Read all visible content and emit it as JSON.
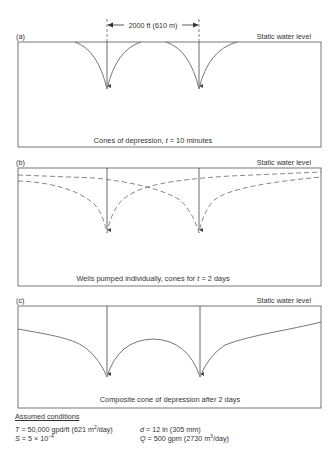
{
  "figure": {
    "dimension_label": "2000 ft (610 m)",
    "panels": [
      {
        "id": "a",
        "tag": "(a)",
        "reference_label": "Static water level",
        "caption_prefix": "Cones of depression, ",
        "caption_var": "t",
        "caption_suffix": " = 10 minutes"
      },
      {
        "id": "b",
        "tag": "(b)",
        "reference_label": "Static water level",
        "caption_prefix": "Wells pumped individually, cones for ",
        "caption_var": "t",
        "caption_suffix": " = 2 days"
      },
      {
        "id": "c",
        "tag": "(c)",
        "reference_label": "Static water level",
        "caption_prefix": "Composite cone of depression after 2 days",
        "caption_var": "",
        "caption_suffix": ""
      }
    ]
  },
  "assumed_conditions": {
    "title": "Assumed conditions",
    "T": {
      "var": "T",
      "value": " = 50,000 gpd/ft (621 m",
      "sup": "2",
      "tail": "/day)"
    },
    "S": {
      "var": "S",
      "value": " = 5 × 10",
      "sup": "−4",
      "tail": ""
    },
    "d": {
      "var": "d",
      "value": " = 12 in (305 mm)",
      "sup": "",
      "tail": ""
    },
    "Q": {
      "var": "Q",
      "value": " = 500 gpm (2730 m",
      "sup": "3",
      "tail": "/day)"
    }
  },
  "colors": {
    "line": "#555555",
    "curve": "#666666",
    "text": "#333333",
    "background": "#ffffff"
  }
}
